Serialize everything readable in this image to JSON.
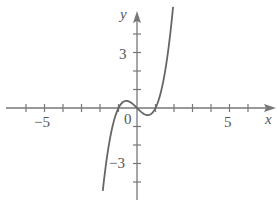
{
  "chart_data": {
    "type": "line",
    "title": "",
    "xlabel": "x",
    "ylabel": "y",
    "xlim": [
      -7,
      7.3
    ],
    "ylim": [
      -5,
      5.6
    ],
    "grid": false,
    "x_tick_labels": [
      "-5",
      "0",
      "5"
    ],
    "y_tick_labels": [
      "3",
      "-3"
    ],
    "x_ticks": [
      -6,
      -5,
      -4,
      -3,
      -2,
      -1,
      1,
      2,
      3,
      4,
      5,
      6
    ],
    "y_ticks": [
      -4,
      -3,
      -2,
      -1,
      1,
      2,
      3,
      4
    ],
    "series": [
      {
        "name": "y = x^3 - x",
        "x": [
          -1.85,
          -1.6,
          -1.4,
          -1.2,
          -1.0,
          -0.8,
          -0.58,
          -0.4,
          -0.2,
          0,
          0.2,
          0.4,
          0.58,
          0.8,
          1.0,
          1.2,
          1.4,
          1.6,
          1.8,
          1.95
        ],
        "y": [
          -4.48,
          -2.5,
          -1.34,
          -0.53,
          0,
          0.29,
          0.38,
          0.34,
          0.19,
          0,
          -0.19,
          -0.34,
          -0.38,
          -0.29,
          0,
          0.53,
          1.34,
          2.5,
          4.03,
          5.46
        ]
      }
    ],
    "color": "#666666"
  },
  "labels": {
    "x_axis": "x",
    "y_axis": "y",
    "x_neg5": "−5",
    "origin": "0",
    "x_pos5": "5",
    "y_pos3": "3",
    "y_neg3": "−3"
  }
}
